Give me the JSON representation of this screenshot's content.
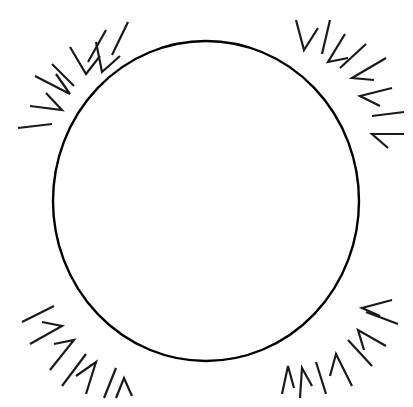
{
  "puzzle": {
    "title": "Circular Word Search Grid",
    "shape": "circle",
    "colors": {
      "ink": "#1a1a1a",
      "background": "#ffffff",
      "circle_stroke": "#000000"
    },
    "rows": [
      {
        "letters": [
          "E",
          "Y",
          "N",
          "S"
        ]
      },
      {
        "letters": [
          "W",
          "T",
          "H",
          "B",
          "Q",
          "L",
          "E",
          "G",
          "P",
          "E"
        ]
      },
      {
        "letters": [
          "E",
          "R",
          "N",
          "W",
          "E",
          "I",
          "C",
          "T",
          "W",
          "L",
          "P",
          "G"
        ]
      },
      {
        "letters": [
          "T",
          "A",
          "O",
          "D",
          "B",
          "G",
          "W",
          "H",
          "A",
          "K",
          "H",
          "R",
          "C",
          "N"
        ]
      },
      {
        "letters": [
          "R",
          "W",
          "D",
          "U",
          "V",
          "H",
          "I",
          "R",
          "E",
          "G",
          "V",
          "W",
          "E",
          "K",
          "G",
          "T"
        ]
      },
      {
        "letters": [
          "W",
          "A",
          "E",
          "J",
          "X",
          "T",
          "J",
          "N",
          "J",
          "T",
          "E",
          "K",
          "R",
          "C",
          "A",
          "L",
          "R",
          "F"
        ]
      },
      {
        "letters": [
          "N",
          "A",
          "L",
          "T",
          "H",
          "R",
          "O",
          "N",
          "E",
          "C",
          "V",
          "M",
          "T",
          "I",
          "L",
          "V",
          "E",
          "M"
        ]
      },
      {
        "letters": [
          "T",
          "J",
          "V",
          "P",
          "V",
          "H",
          "S",
          "I",
          "R",
          "W",
          "L",
          "G",
          "L",
          "O",
          "R",
          "Y",
          "E",
          "Q"
        ]
      },
      {
        "letters": [
          "H",
          "Q",
          "L",
          "E",
          "M",
          "H",
          "W",
          "D",
          "N",
          "J",
          "R",
          "E",
          "C",
          "N",
          "U",
          "C",
          "L",
          "O",
          "N",
          "G"
        ]
      },
      {
        "letters": [
          "N",
          "O",
          "P",
          "A",
          "I",
          "N",
          "A",
          "R",
          "G",
          "O",
          "D",
          "W",
          "A",
          "C",
          "S",
          "A",
          "H",
          "F",
          "C",
          "O"
        ]
      },
      {
        "letters": [
          "E",
          "O",
          "K",
          "N",
          "Y",
          "W",
          "T",
          "A",
          "A",
          "H",
          "N",
          "T",
          "Q",
          "R",
          "S",
          "J",
          "O",
          "L",
          "A",
          "L"
        ]
      },
      {
        "letters": [
          "J",
          "R",
          "S",
          "G",
          "L",
          "K",
          "E",
          "C",
          "N",
          "L",
          "A",
          "M",
          "B",
          "U",
          "T",
          "D",
          "L",
          "I",
          "R",
          "D"
        ]
      },
      {
        "letters": [
          "F",
          "Q",
          "E",
          "P",
          "U",
          "R",
          "E",
          "D",
          "D",
          "H",
          "T",
          "R",
          "V",
          "O",
          "H",
          "Y",
          "F",
          "J"
        ]
      },
      {
        "letters": [
          "H",
          "J",
          "L",
          "A",
          "W",
          "O",
          "L",
          "T",
          "L",
          "O",
          "E",
          "P",
          "Q",
          "N",
          "M",
          "C",
          "E",
          "W"
        ]
      },
      {
        "letters": [
          "G",
          "T",
          "S",
          "V",
          "J",
          "F",
          "I",
          "H",
          "N",
          "J",
          "M",
          "N",
          "A",
          "E",
          "T",
          "I",
          "K",
          "L"
        ]
      },
      {
        "letters": [
          "H",
          "W",
          "A",
          "L",
          "L",
          "S",
          "E",
          "W",
          "R",
          "C",
          "E",
          "J",
          "S",
          "O",
          "T",
          "D"
        ]
      },
      {
        "letters": [
          "R",
          "J",
          "M",
          "I",
          "H",
          "E",
          "N",
          "O",
          "N",
          "I",
          "G",
          "H",
          "T",
          "Y"
        ]
      },
      {
        "letters": [
          "C",
          "L",
          "F",
          "N",
          "N",
          "T",
          "A",
          "J",
          "F",
          "C",
          "A",
          "C"
        ]
      },
      {
        "letters": [
          "K",
          "E",
          "B",
          "D",
          "P",
          "E",
          "A",
          "R",
          "L",
          "S"
        ]
      },
      {
        "letters": [
          "K",
          "P",
          "L",
          "D"
        ]
      }
    ]
  }
}
